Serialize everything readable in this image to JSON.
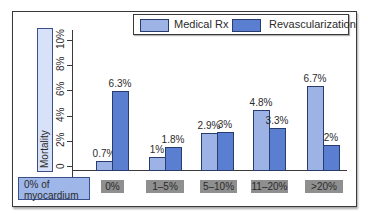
{
  "chart_data": {
    "type": "bar",
    "title": "",
    "xlabel": "% of myocardium",
    "ylabel": "Mortality",
    "ylim": [
      0,
      10
    ],
    "yticks": [
      "0",
      "2%",
      "4%",
      "6%",
      "8%",
      "10%"
    ],
    "categories": [
      "0%",
      "1–5%",
      "5–10%",
      "11–20%",
      ">20%"
    ],
    "series": [
      {
        "name": "Medical Rx",
        "values": [
          0.7,
          1,
          2.9,
          4.8,
          6.7
        ],
        "labels": [
          "0.7%",
          "1%",
          "2.9%",
          "4.8%",
          "6.7%"
        ],
        "color": "#9db3e6"
      },
      {
        "name": "Revascularization",
        "values": [
          6.3,
          1.8,
          3,
          3.3,
          2
        ],
        "labels": [
          "6.3%",
          "1.8%",
          "3%",
          "3.3%",
          "2%"
        ],
        "color": "#5b7fd0"
      }
    ],
    "legend_position": "top-right",
    "grid": false
  },
  "legend": {
    "medical": "Medical Rx",
    "revasc": "Revascularization"
  },
  "axis": {
    "ylabel": "Mortality",
    "xlabel_line1": "0% of",
    "xlabel_line2": "myocardium"
  }
}
